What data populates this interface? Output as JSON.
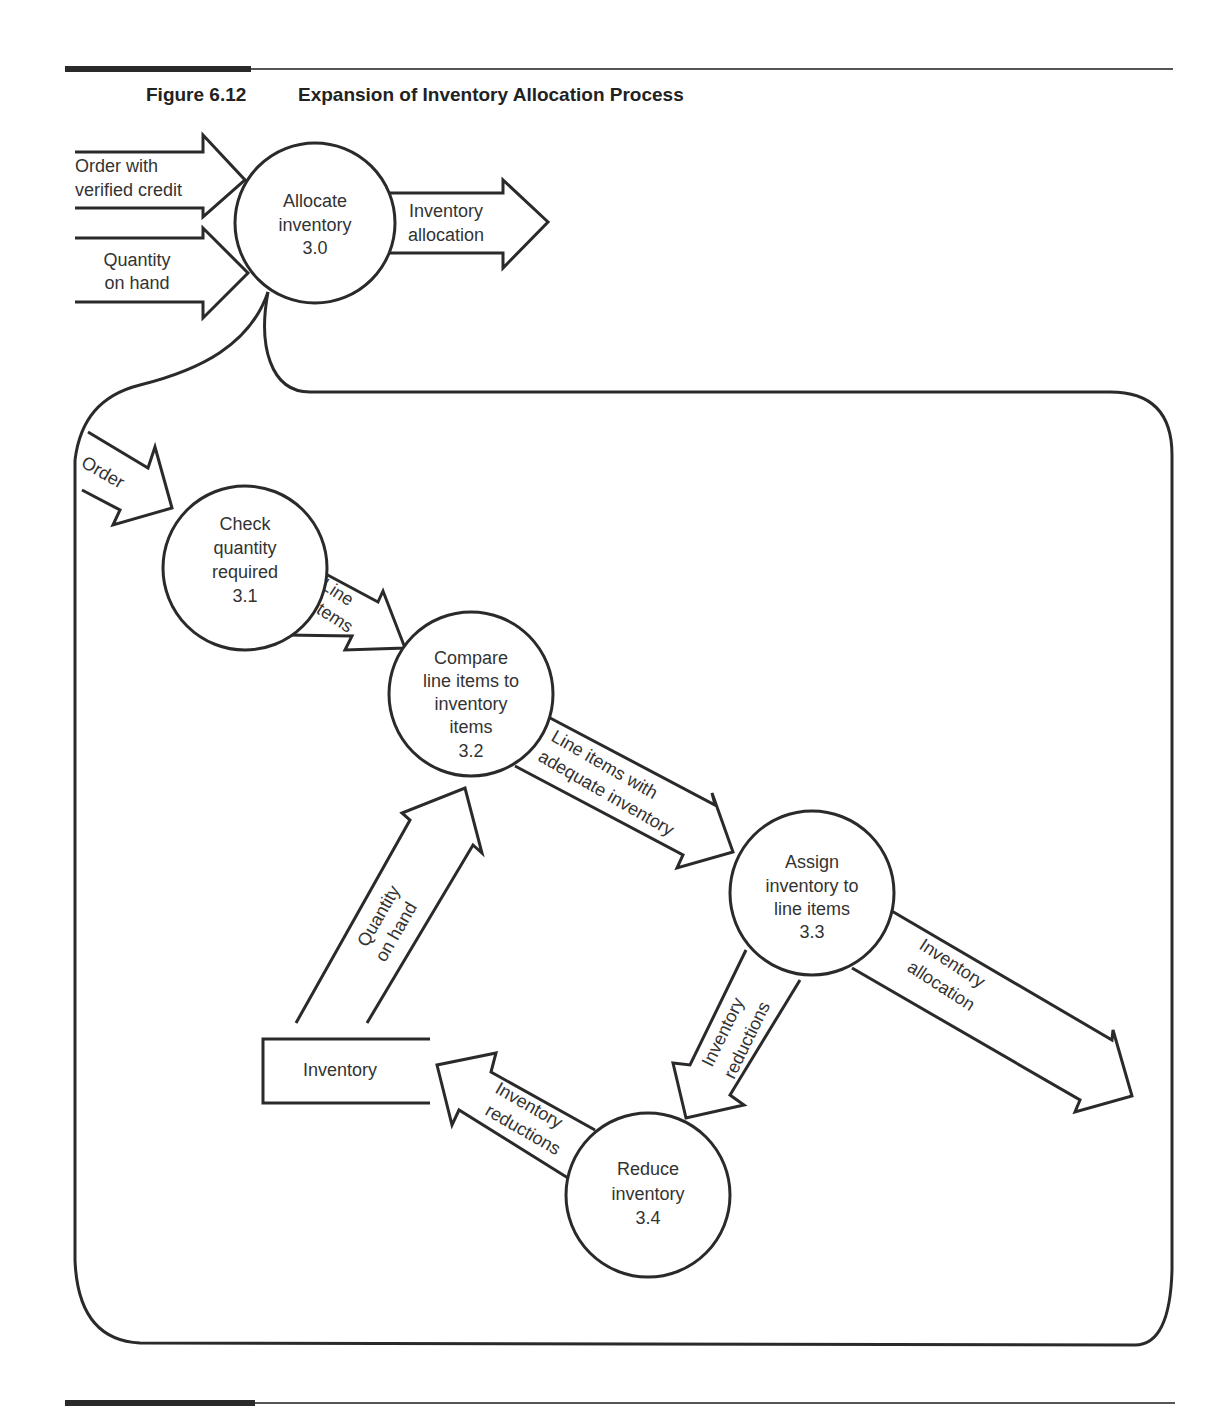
{
  "figure": {
    "number": "Figure 6.12",
    "title": "Expansion of Inventory Allocation Process"
  },
  "context": {
    "process": {
      "line1": "Allocate",
      "line2": "inventory",
      "id": "3.0"
    },
    "inputs": [
      {
        "line1": "Order with",
        "line2": "verified credit"
      },
      {
        "line1": "Quantity",
        "line2": "on hand"
      }
    ],
    "output": {
      "line1": "Inventory",
      "line2": "allocation"
    }
  },
  "expansion": {
    "processes": [
      {
        "id": "3.1",
        "lines": [
          "Check",
          "quantity",
          "required",
          "3.1"
        ]
      },
      {
        "id": "3.2",
        "lines": [
          "Compare",
          "line items to",
          "inventory",
          "items",
          "3.2"
        ]
      },
      {
        "id": "3.3",
        "lines": [
          "Assign",
          "inventory to",
          "line items",
          "3.3"
        ]
      },
      {
        "id": "3.4",
        "lines": [
          "Reduce",
          "inventory",
          "3.4"
        ]
      }
    ],
    "data_store": {
      "label": "Inventory"
    },
    "flows": [
      {
        "from": "external",
        "to": "3.1",
        "lines": [
          "Order"
        ]
      },
      {
        "from": "3.1",
        "to": "3.2",
        "lines": [
          "Line",
          "items"
        ]
      },
      {
        "from": "3.2",
        "to": "3.3",
        "lines": [
          "Line items with",
          "adequate inventory"
        ]
      },
      {
        "from": "Inventory",
        "to": "3.2",
        "lines": [
          "Quantity",
          "on hand"
        ]
      },
      {
        "from": "3.3",
        "to": "external",
        "lines": [
          "Inventory",
          "allocation"
        ]
      },
      {
        "from": "3.3",
        "to": "3.4",
        "lines": [
          "Inventory",
          "reductions"
        ]
      },
      {
        "from": "3.4",
        "to": "Inventory",
        "lines": [
          "Inventory",
          "reductions"
        ]
      }
    ]
  }
}
